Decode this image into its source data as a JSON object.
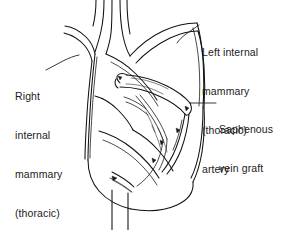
{
  "figure": {
    "kind": "medical-line-illustration",
    "background_color": "#ffffff",
    "ink_color": "#111111",
    "width": 294,
    "height": 230
  },
  "labels": {
    "left_ima": {
      "name": "Left internal mammary (thoracic) artery",
      "lines": [
        "Left internal",
        "mammary",
        "(thoracic)",
        "artery"
      ]
    },
    "right_ima": {
      "name": "Right internal mammary (thoracic) artery",
      "lines": [
        "Right",
        "internal",
        "mammary",
        "(thoracic)",
        "artery"
      ]
    },
    "saphenous": {
      "name": "Saphenous vein graft",
      "lines": [
        "Saphenous",
        "vein graft"
      ]
    }
  }
}
